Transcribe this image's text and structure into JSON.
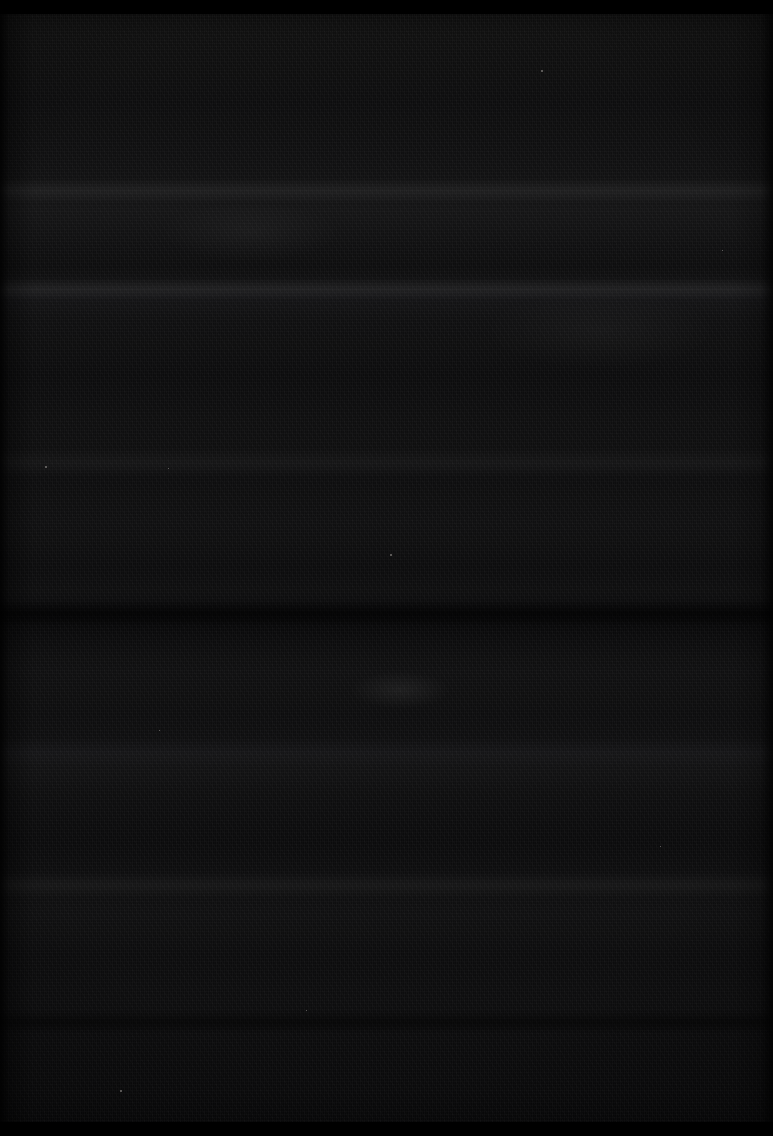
{
  "image": {
    "subject": "black woven textile close-up",
    "scene_description": "Extreme close-up photograph of a dark, nearly black woven fabric filling the entire frame. Subtle horizontal weave ridges catch faint light, creating soft lighter bands across the cloth. A fine vertical warp grain and a faint diagonal twill sheen are visible at high magnification. The top and bottom edges are scalloped and very dark. A few tiny pale lint fibers speckle the surface.",
    "orientation": "portrait",
    "width_px": 773,
    "height_px": 1136,
    "contains_text": false,
    "contains_ui": false,
    "dominant_tone": "near-black",
    "colors": {
      "darkest": "#000000",
      "base_cloth": "#0d0d0e",
      "mid_cloth": "#111112",
      "lightest_ridge": "#151517",
      "lint_speck": "#d7d4cd"
    },
    "features": [
      {
        "name": "weave-ridge-band",
        "type": "highlight",
        "center_y_px": 190,
        "thickness_px": 26
      },
      {
        "name": "weave-ridge-band",
        "type": "highlight",
        "center_y_px": 288,
        "thickness_px": 22
      },
      {
        "name": "weave-ridge-band",
        "type": "highlight",
        "center_y_px": 462,
        "thickness_px": 30
      },
      {
        "name": "weave-seam-band",
        "type": "shadow",
        "center_y_px": 614,
        "thickness_px": 26
      },
      {
        "name": "weave-ridge-band",
        "type": "highlight",
        "center_y_px": 752,
        "thickness_px": 30
      },
      {
        "name": "weave-ridge-band",
        "type": "highlight",
        "center_y_px": 884,
        "thickness_px": 26
      },
      {
        "name": "weave-seam-band",
        "type": "shadow",
        "center_y_px": 1022,
        "thickness_px": 24
      },
      {
        "name": "fold-highlight-streak",
        "type": "highlight",
        "center_x_px": 400,
        "center_y_px": 690
      }
    ],
    "lint_specks": [
      {
        "x_px": 541,
        "y_px": 70,
        "size_px": 2
      },
      {
        "x_px": 45,
        "y_px": 466,
        "size_px": 2
      },
      {
        "x_px": 168,
        "y_px": 468,
        "size_px": 1
      },
      {
        "x_px": 390,
        "y_px": 554,
        "size_px": 2
      },
      {
        "x_px": 159,
        "y_px": 730,
        "size_px": 1
      },
      {
        "x_px": 120,
        "y_px": 1090,
        "size_px": 2
      },
      {
        "x_px": 306,
        "y_px": 1010,
        "size_px": 1
      },
      {
        "x_px": 660,
        "y_px": 846,
        "size_px": 1
      },
      {
        "x_px": 722,
        "y_px": 250,
        "size_px": 1
      }
    ]
  }
}
